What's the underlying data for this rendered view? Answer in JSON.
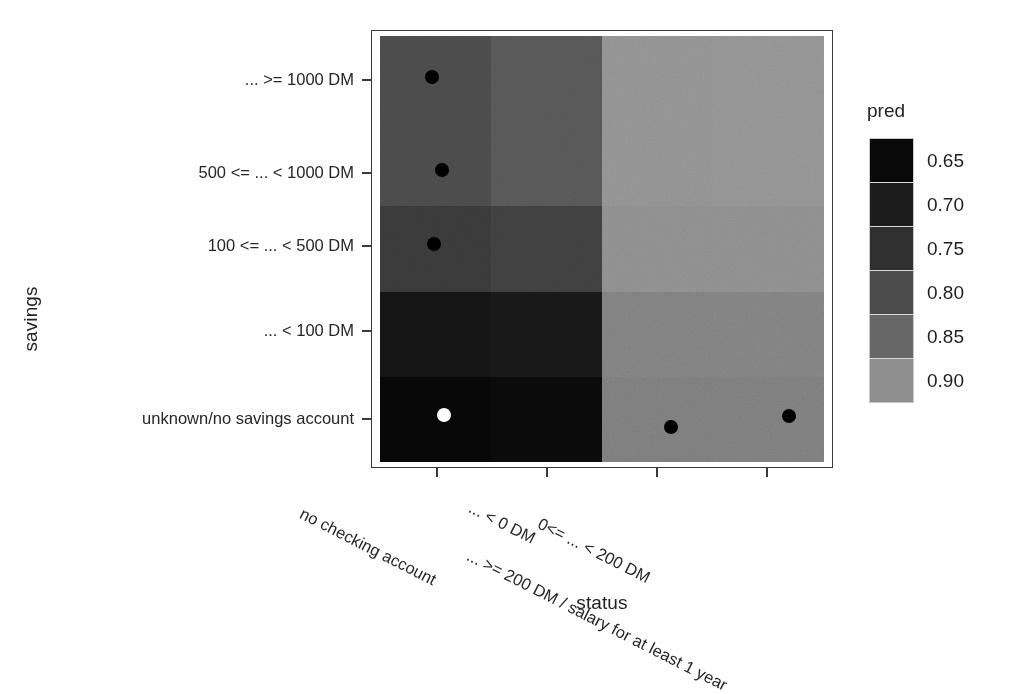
{
  "chart_data": {
    "type": "heatmap",
    "title": "",
    "xlabel": "status",
    "ylabel": "savings",
    "legend_title": "pred",
    "legend_position": "right",
    "grid": false,
    "x_categories": [
      "no checking account",
      "... < 0 DM",
      "0<= ... < 200 DM",
      "... >= 200 DM / salary for at least 1 year"
    ],
    "y_categories": [
      "unknown/no savings account",
      "... < 100 DM",
      "100 <= ... < 500 DM",
      "500 <= ... < 1000 DM",
      "... >= 1000 DM"
    ],
    "y_categories_top_to_bottom": [
      "... >= 1000 DM",
      "500 <= ... < 1000 DM",
      "100 <= ... < 500 DM",
      "... < 100 DM",
      "unknown/no savings account"
    ],
    "zlim": [
      0.63,
      0.92
    ],
    "legend_ticks": [
      "0.65",
      "0.70",
      "0.75",
      "0.80",
      "0.85",
      "0.90"
    ],
    "legend_colors": [
      "#090909",
      "#1c1c1c",
      "#303030",
      "#4b4b4b",
      "#676767",
      "#8f8f8f"
    ],
    "values_top_to_bottom": [
      [
        0.8,
        0.81,
        0.9,
        0.9
      ],
      [
        0.8,
        0.81,
        0.9,
        0.9
      ],
      [
        0.77,
        0.78,
        0.89,
        0.89
      ],
      [
        0.68,
        0.69,
        0.86,
        0.86
      ],
      [
        0.65,
        0.65,
        0.85,
        0.85
      ]
    ],
    "cell_colors_top_to_bottom": [
      [
        "#4a4a4a",
        "#565656",
        "#919191",
        "#929292"
      ],
      [
        "#4a4a4a",
        "#565656",
        "#919191",
        "#929292"
      ],
      [
        "#393939",
        "#3f3f3f",
        "#8d8d8d",
        "#8d8d8d"
      ],
      [
        "#141414",
        "#181818",
        "#7f7f7f",
        "#808080"
      ],
      [
        "#070707",
        "#0a0a0a",
        "#7c7c7c",
        "#7d7d7d"
      ]
    ],
    "points": [
      {
        "label": "point-1",
        "x_category": "no checking account",
        "y_category": "... >= 1000 DM",
        "color": "#000000",
        "left_pct": 11.7,
        "top_pct": 9.6
      },
      {
        "label": "point-2",
        "x_category": "no checking account",
        "y_category": "500 <= ... < 1000 DM",
        "color": "#000000",
        "left_pct": 14.0,
        "top_pct": 31.4
      },
      {
        "label": "point-3",
        "x_category": "no checking account",
        "y_category": "100 <= ... < 500 DM",
        "color": "#000000",
        "left_pct": 12.2,
        "top_pct": 48.8
      },
      {
        "label": "point-4",
        "x_category": "no checking account",
        "y_category": "unknown/no savings account",
        "color": "#ffffff",
        "left_pct": 14.4,
        "top_pct": 89.0
      },
      {
        "label": "point-5",
        "x_category": "0<= ... < 200 DM",
        "y_category": "unknown/no savings account",
        "color": "#000000",
        "left_pct": 65.5,
        "top_pct": 91.8
      },
      {
        "label": "point-6",
        "x_category": "... >= 200 DM / salary for at least 1 year",
        "y_category": "unknown/no savings account",
        "color": "#000000",
        "left_pct": 92.1,
        "top_pct": 89.2
      }
    ]
  },
  "axes": {
    "y_title": "savings",
    "x_title": "status",
    "y_tick_labels": [
      "... >= 1000 DM",
      "500 <= ... < 1000 DM",
      "100 <= ... < 500 DM",
      "... < 100 DM",
      "unknown/no savings account"
    ],
    "x_tick_labels": [
      "no checking account",
      "... < 0 DM",
      "0<= ... < 200 DM",
      "... >= 200 DM / salary for at least 1 year"
    ]
  },
  "legend": {
    "title": "pred",
    "entries": [
      {
        "value": "0.65",
        "color": "#090909"
      },
      {
        "value": "0.70",
        "color": "#1c1c1c"
      },
      {
        "value": "0.75",
        "color": "#303030"
      },
      {
        "value": "0.80",
        "color": "#4b4b4b"
      },
      {
        "value": "0.85",
        "color": "#676767"
      },
      {
        "value": "0.90",
        "color": "#8f8f8f"
      }
    ]
  },
  "colors": {
    "background": "#ffffff",
    "panel_border": "#3a3a3a",
    "text": "#222222",
    "point_dark": "#000000",
    "point_light": "#ffffff"
  }
}
